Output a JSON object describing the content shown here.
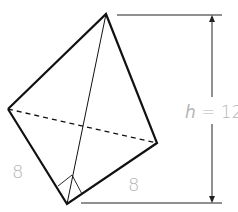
{
  "diagram": {
    "type": "tetrahedron-pyramid",
    "labels": {
      "height": "h = 12",
      "height_var": "h",
      "height_eq": " = 12",
      "left_edge": "8",
      "bottom_edge": "8"
    },
    "colors": {
      "edge": "#111111",
      "label": "#b5b5b5",
      "background": "#ffffff"
    }
  }
}
